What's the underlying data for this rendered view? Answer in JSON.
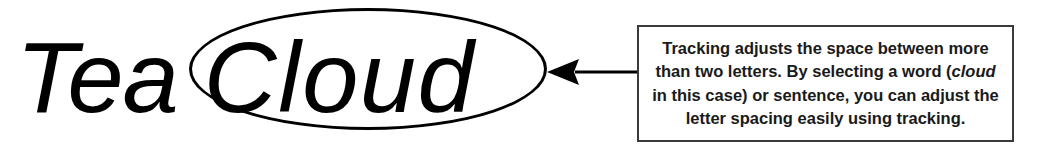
{
  "figure": {
    "name": "tracking-example-figure",
    "background_color": "#ffffff",
    "ink_color": "#000000"
  },
  "sample": {
    "full_text": "Tea Cloud",
    "plain_word": "Tea",
    "tracked_word": "Cloud",
    "style": "italic sans-serif",
    "highlight_shape": "ellipse",
    "highlight_target": "Cloud"
  },
  "arrow": {
    "icon": "arrow-left-icon",
    "direction": "left",
    "points_from": "caption-box",
    "points_to": "ellipse-highlight"
  },
  "caption": {
    "lines": [
      "Tracking adjusts the space between more",
      "than two letters. By selecting a word (cloud",
      "in this case) or sentence, you can adjust the",
      "letter spacing easily using tracking."
    ],
    "line1": "Tracking adjusts the space between more",
    "line2_before_italic": "than two letters. By selecting a word (",
    "line2_italic": "cloud",
    "line3": "in this case) or sentence, you can adjust the",
    "line4": "letter spacing easily using tracking.",
    "border_color": "#3a3a3a",
    "text_color": "#1a1a1a"
  }
}
